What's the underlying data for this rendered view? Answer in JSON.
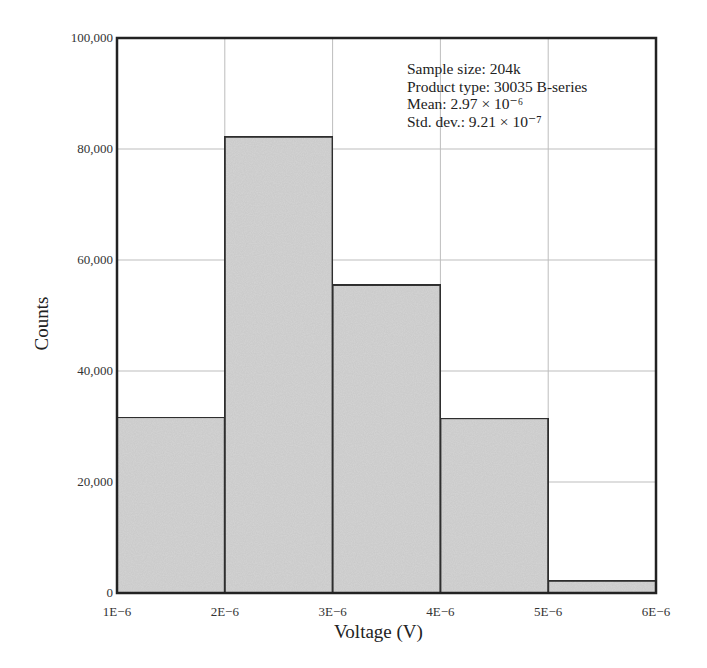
{
  "chart_data": {
    "type": "bar",
    "subtype": "histogram",
    "title": "",
    "xlabel": "Voltage (V)",
    "ylabel": "Counts",
    "bin_edges": [
      1e-06,
      2e-06,
      3e-06,
      4e-06,
      5e-06,
      6e-06
    ],
    "categories": [
      "1E-6–2E-6",
      "2E-6–3E-6",
      "3E-6–4E-6",
      "4E-6–5E-6",
      "5E-6–6E-6"
    ],
    "values": [
      31700,
      82200,
      55500,
      31500,
      2200
    ],
    "xlim": [
      1e-06,
      6e-06
    ],
    "ylim": [
      0,
      100000
    ],
    "x_ticks": [
      1e-06,
      2e-06,
      3e-06,
      4e-06,
      5e-06,
      6e-06
    ],
    "x_tick_labels": [
      "1E−6",
      "2E−6",
      "3E−6",
      "4E−6",
      "5E−6",
      "6E−6"
    ],
    "y_ticks": [
      0,
      20000,
      40000,
      60000,
      80000,
      100000
    ],
    "y_tick_labels": [
      "0",
      "20,000",
      "40,000",
      "60,000",
      "80,000",
      "100,000"
    ],
    "grid": true,
    "bar_color": "#d4d4d4",
    "edge_color": "#333333",
    "grid_color": "#bdbdbd",
    "annotations": [
      "Sample size: 204k",
      "Product type: 30035 B-series",
      "Mean: 2.97 × 10⁻⁶",
      "Std. dev.: 9.21 × 10⁻⁷"
    ],
    "annotation_placement": "top-right"
  }
}
